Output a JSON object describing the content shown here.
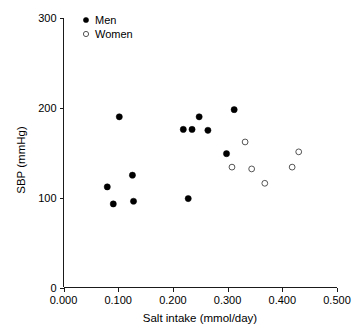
{
  "chart_data": {
    "type": "scatter",
    "title": "",
    "xlabel": "Salt intake (mmol/day)",
    "ylabel": "SBP (mmHg)",
    "xlim": [
      0.0,
      0.5
    ],
    "ylim": [
      0,
      300
    ],
    "xticks": [
      0.0,
      0.1,
      0.2,
      0.3,
      0.4,
      0.5
    ],
    "xtick_labels": [
      "0.000",
      "0.100",
      "0.200",
      "0.300",
      "0.400",
      "0.500"
    ],
    "yticks": [
      0,
      100,
      200,
      300
    ],
    "ytick_labels": [
      "0",
      "100",
      "200",
      "300"
    ],
    "grid": false,
    "legend_position": "top-left",
    "series": [
      {
        "name": "Men",
        "marker": "filled-circle",
        "color": "#000000",
        "points": [
          {
            "x": 0.102,
            "y": 190
          },
          {
            "x": 0.08,
            "y": 112
          },
          {
            "x": 0.091,
            "y": 93
          },
          {
            "x": 0.126,
            "y": 125
          },
          {
            "x": 0.128,
            "y": 96
          },
          {
            "x": 0.219,
            "y": 176
          },
          {
            "x": 0.235,
            "y": 176
          },
          {
            "x": 0.228,
            "y": 99
          },
          {
            "x": 0.248,
            "y": 190
          },
          {
            "x": 0.298,
            "y": 149
          },
          {
            "x": 0.312,
            "y": 198
          },
          {
            "x": 0.264,
            "y": 175
          }
        ]
      },
      {
        "name": "Women",
        "marker": "open-circle",
        "color": "#555555",
        "points": [
          {
            "x": 0.308,
            "y": 134
          },
          {
            "x": 0.332,
            "y": 162
          },
          {
            "x": 0.344,
            "y": 132
          },
          {
            "x": 0.368,
            "y": 116
          },
          {
            "x": 0.418,
            "y": 134
          },
          {
            "x": 0.43,
            "y": 151
          }
        ]
      }
    ]
  },
  "legend": {
    "entries": [
      {
        "label": "Men",
        "marker": "filled-circle"
      },
      {
        "label": "Women",
        "marker": "open-circle"
      }
    ]
  }
}
